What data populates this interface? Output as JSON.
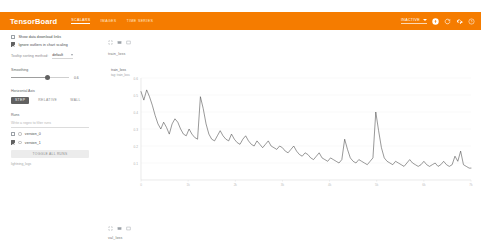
{
  "header": {
    "brand": "TensorBoard",
    "tabs": [
      {
        "label": "SCALARS",
        "active": true
      },
      {
        "label": "IMAGES",
        "active": false
      },
      {
        "label": "TIME SERIES",
        "active": false
      }
    ],
    "run_selector_value": "INACTIVE",
    "icons": [
      "upload-icon",
      "refresh-icon",
      "settings-icon",
      "help-icon"
    ],
    "bar_color": "#f57c00"
  },
  "sidebar": {
    "show_download_links_label": "Show data download links",
    "show_download_links_checked": false,
    "ignore_outliers_label": "Ignore outliers in chart scaling",
    "ignore_outliers_checked": true,
    "tooltip_sorting_label": "Tooltip sorting method:",
    "tooltip_sorting_value": "default",
    "smoothing_label": "Smoothing",
    "smoothing_value": "0.6",
    "horizontal_axis_label": "Horizontal Axis",
    "axis_options": [
      {
        "label": "STEP",
        "selected": true
      },
      {
        "label": "RELATIVE",
        "selected": false
      },
      {
        "label": "WALL",
        "selected": false
      }
    ],
    "runs_label": "Runs",
    "runs_filter_placeholder": "Write a regex to filter runs",
    "runs": [
      {
        "name": "version_0",
        "checked": false
      },
      {
        "name": "version_1",
        "checked": true
      }
    ],
    "toggle_all_label": "TOGGLE ALL RUNS",
    "logdir_hint": "lightning_logs"
  },
  "main": {
    "group_label": "train_loss",
    "bottom_group_label": "val_loss",
    "card_tool_icons": [
      "expand-icon",
      "brush-icon",
      "fullscreen-icon"
    ],
    "bottom_tool_icons": [
      "expand-icon",
      "brush-icon",
      "fullscreen-icon"
    ]
  },
  "chart_data": {
    "type": "line",
    "title": "train_loss",
    "subtitle": "tag: train_loss",
    "xlabel": "",
    "ylabel": "",
    "grid": true,
    "legend": "none",
    "series_color": "#444444",
    "ylim": [
      0.0,
      0.6
    ],
    "xlim": [
      0,
      7000
    ],
    "yticks": [
      0.6,
      0.5,
      0.4,
      0.3,
      0.2,
      0.1
    ],
    "ytick_labels": [
      "0.6",
      "0.5",
      "0.4",
      "0.3",
      "0.2",
      "0.1"
    ],
    "xticks": [
      0,
      1000,
      2000,
      3000,
      4000,
      5000,
      6000,
      7000
    ],
    "xtick_labels": [
      "0",
      "1k",
      "2k",
      "3k",
      "4k",
      "5k",
      "6k",
      "7k"
    ],
    "series": [
      {
        "name": "version_1",
        "x": [
          0,
          60,
          120,
          180,
          240,
          300,
          360,
          420,
          480,
          540,
          600,
          660,
          720,
          780,
          840,
          900,
          960,
          1020,
          1080,
          1140,
          1200,
          1260,
          1320,
          1380,
          1440,
          1500,
          1560,
          1620,
          1680,
          1740,
          1800,
          1860,
          1920,
          1980,
          2040,
          2100,
          2160,
          2220,
          2280,
          2340,
          2400,
          2460,
          2520,
          2580,
          2640,
          2700,
          2760,
          2820,
          2880,
          2940,
          3000,
          3060,
          3120,
          3180,
          3240,
          3300,
          3360,
          3420,
          3480,
          3540,
          3600,
          3660,
          3720,
          3780,
          3840,
          3900,
          3960,
          4020,
          4080,
          4140,
          4200,
          4260,
          4320,
          4380,
          4440,
          4500,
          4560,
          4620,
          4680,
          4740,
          4800,
          4860,
          4920,
          4980,
          5040,
          5100,
          5160,
          5220,
          5280,
          5340,
          5400,
          5460,
          5520,
          5580,
          5640,
          5700,
          5760,
          5820,
          5880,
          5940,
          6000,
          6060,
          6120,
          6180,
          6240,
          6300,
          6360,
          6420,
          6480,
          6540,
          6600,
          6660,
          6720,
          6780,
          6840,
          6900,
          6960,
          7000
        ],
        "y": [
          0.52,
          0.47,
          0.53,
          0.49,
          0.44,
          0.38,
          0.33,
          0.3,
          0.34,
          0.31,
          0.27,
          0.33,
          0.36,
          0.34,
          0.3,
          0.27,
          0.26,
          0.3,
          0.27,
          0.25,
          0.24,
          0.49,
          0.42,
          0.33,
          0.27,
          0.24,
          0.23,
          0.26,
          0.29,
          0.26,
          0.24,
          0.23,
          0.27,
          0.24,
          0.22,
          0.21,
          0.24,
          0.26,
          0.23,
          0.21,
          0.2,
          0.23,
          0.21,
          0.19,
          0.21,
          0.23,
          0.2,
          0.19,
          0.18,
          0.2,
          0.19,
          0.17,
          0.16,
          0.18,
          0.2,
          0.17,
          0.15,
          0.14,
          0.16,
          0.15,
          0.13,
          0.12,
          0.14,
          0.16,
          0.13,
          0.12,
          0.11,
          0.13,
          0.12,
          0.11,
          0.1,
          0.12,
          0.24,
          0.18,
          0.13,
          0.11,
          0.1,
          0.12,
          0.11,
          0.1,
          0.09,
          0.11,
          0.13,
          0.4,
          0.29,
          0.19,
          0.13,
          0.11,
          0.1,
          0.09,
          0.11,
          0.1,
          0.09,
          0.08,
          0.1,
          0.12,
          0.1,
          0.09,
          0.08,
          0.09,
          0.11,
          0.09,
          0.08,
          0.09,
          0.1,
          0.08,
          0.09,
          0.11,
          0.09,
          0.08,
          0.09,
          0.14,
          0.11,
          0.17,
          0.09,
          0.08,
          0.07,
          0.07
        ]
      }
    ]
  }
}
